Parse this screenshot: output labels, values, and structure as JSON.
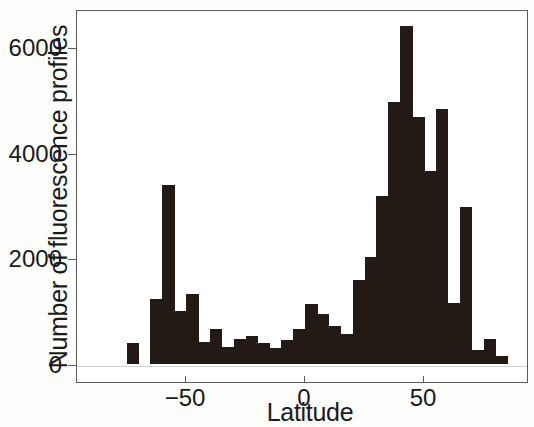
{
  "chart_data": {
    "type": "bar",
    "title": "",
    "xlabel": "Latitude",
    "ylabel": "Number of fluorescence profiles",
    "xlim": [
      -80,
      90
    ],
    "ylim": [
      0,
      6800
    ],
    "bin_width": 5,
    "grid": false,
    "legend": null,
    "x_ticks": [
      -50,
      0,
      50
    ],
    "x_tick_labels": [
      "−50",
      "0",
      "50"
    ],
    "y_ticks": [
      0,
      2000,
      4000,
      6000
    ],
    "y_tick_labels": [
      "0",
      "2000",
      "4000",
      "6000"
    ],
    "bar_color": "#231a16",
    "categories": [
      -75,
      -70,
      -65,
      -60,
      -55,
      -50,
      -45,
      -40,
      -35,
      -30,
      -25,
      -20,
      -15,
      -10,
      -5,
      0,
      5,
      10,
      15,
      20,
      25,
      30,
      35,
      40,
      45,
      50,
      55,
      60,
      65,
      70,
      75,
      80
    ],
    "values": [
      390,
      0,
      1240,
      3380,
      1000,
      1320,
      420,
      660,
      330,
      480,
      530,
      400,
      300,
      460,
      660,
      1130,
      950,
      720,
      570,
      1590,
      2030,
      3180,
      4960,
      6400,
      4680,
      3660,
      4830,
      1160,
      2980,
      270,
      480,
      160
    ]
  },
  "axes": {
    "y_label_positions": [
      {
        "label": "6000",
        "value": 6000
      },
      {
        "label": "4000",
        "value": 4000
      },
      {
        "label": "2000",
        "value": 2000
      },
      {
        "label": "0",
        "value": 0
      }
    ],
    "x_label_positions": [
      {
        "label": "−50",
        "value": -50
      },
      {
        "label": "0",
        "value": 0
      },
      {
        "label": "50",
        "value": 50
      }
    ]
  }
}
